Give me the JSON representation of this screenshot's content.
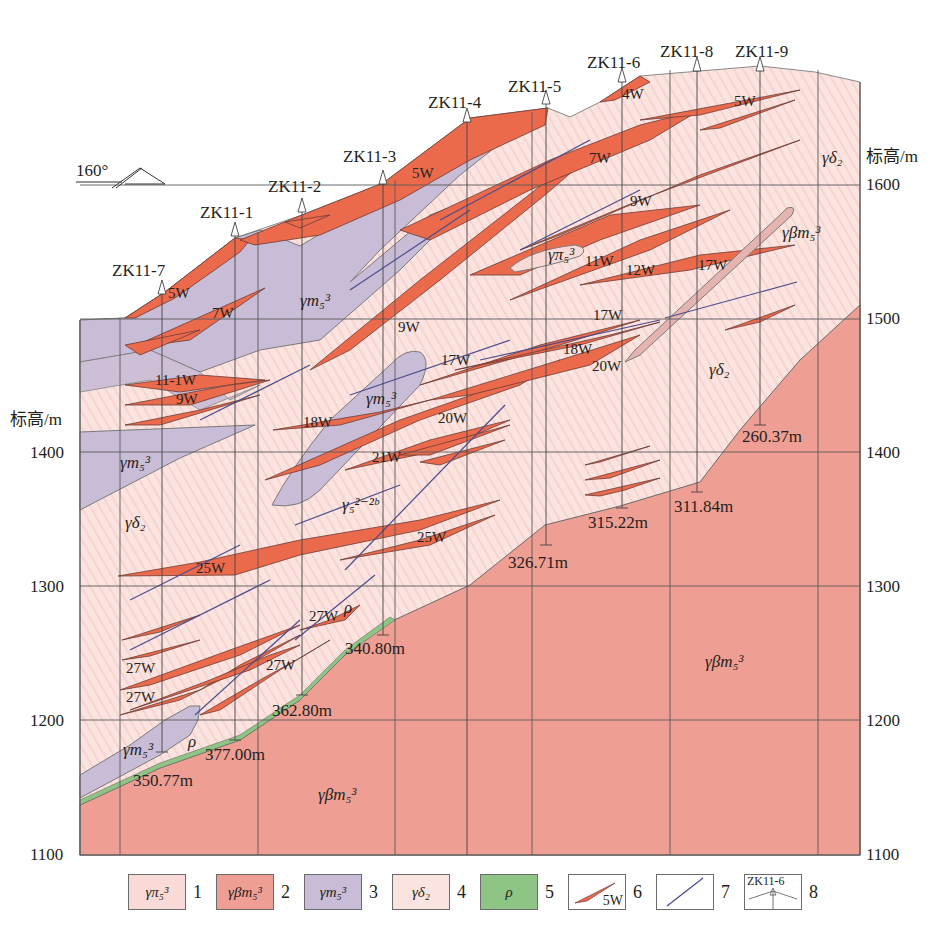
{
  "diagram": {
    "type": "geological-cross-section",
    "orientation": {
      "label": "160°"
    },
    "elevation_axis": {
      "title": "标高/m",
      "ticks": [
        1600,
        1500,
        1400,
        1300,
        1200,
        1100
      ],
      "left_ticks": [
        1400,
        1300,
        1200,
        1100
      ],
      "right_ticks": [
        1600,
        1500,
        1400,
        1300,
        1200,
        1100
      ]
    },
    "boreholes": [
      {
        "id": "ZK11-7",
        "x": 162,
        "top": 290,
        "bottom": 752,
        "depth": "350.77m",
        "depth_label_x": 133,
        "depth_label_y": 786
      },
      {
        "id": "ZK11-1",
        "x": 235,
        "top": 232,
        "bottom": 740,
        "depth": "377.00m",
        "depth_label_x": 205,
        "depth_label_y": 760
      },
      {
        "id": "ZK11-2",
        "x": 302,
        "top": 208,
        "bottom": 695,
        "depth": "362.80m",
        "depth_label_x": 272,
        "depth_label_y": 716
      },
      {
        "id": "ZK11-3",
        "x": 383,
        "top": 180,
        "bottom": 635,
        "depth": "340.80m",
        "depth_label_x": 345,
        "depth_label_y": 654
      },
      {
        "id": "ZK11-4",
        "x": 467,
        "top": 118,
        "bottom": 0,
        "depth": "",
        "depth_label_x": 0,
        "depth_label_y": 0
      },
      {
        "id": "ZK11-5",
        "x": 546,
        "top": 100,
        "bottom": 545,
        "depth": "326.71m",
        "depth_label_x": 508,
        "depth_label_y": 568
      },
      {
        "id": "ZK11-6",
        "x": 622,
        "top": 78,
        "bottom": 508,
        "depth": "315.22m",
        "depth_label_x": 588,
        "depth_label_y": 528
      },
      {
        "id": "ZK11-8",
        "x": 697,
        "top": 67,
        "bottom": 492,
        "depth": "311.84m",
        "depth_label_x": 674,
        "depth_label_y": 512
      },
      {
        "id": "ZK11-9",
        "x": 760,
        "top": 67,
        "bottom": 425,
        "depth": "260.37m",
        "depth_label_x": 742,
        "depth_label_y": 442
      }
    ],
    "borehole_labels": [
      {
        "id": "ZK11-7",
        "x": 112,
        "y": 276
      },
      {
        "id": "ZK11-1",
        "x": 200,
        "y": 218
      },
      {
        "id": "ZK11-2",
        "x": 268,
        "y": 192
      },
      {
        "id": "ZK11-3",
        "x": 343,
        "y": 162
      },
      {
        "id": "ZK11-4",
        "x": 428,
        "y": 108
      },
      {
        "id": "ZK11-5",
        "x": 508,
        "y": 92
      },
      {
        "id": "ZK11-6",
        "x": 587,
        "y": 68
      },
      {
        "id": "ZK11-8",
        "x": 660,
        "y": 57
      },
      {
        "id": "ZK11-9",
        "x": 735,
        "y": 57
      }
    ],
    "vein_labels": [
      {
        "text": "5W",
        "x": 168,
        "y": 298
      },
      {
        "text": "7W",
        "x": 212,
        "y": 318
      },
      {
        "text": "11-1W",
        "x": 155,
        "y": 385
      },
      {
        "text": "9W",
        "x": 176,
        "y": 404
      },
      {
        "text": "18W",
        "x": 303,
        "y": 427
      },
      {
        "text": "21W",
        "x": 372,
        "y": 462
      },
      {
        "text": "20W",
        "x": 438,
        "y": 423
      },
      {
        "text": "17W",
        "x": 441,
        "y": 365
      },
      {
        "text": "9W",
        "x": 398,
        "y": 332
      },
      {
        "text": "5W",
        "x": 412,
        "y": 178
      },
      {
        "text": "7W",
        "x": 589,
        "y": 163
      },
      {
        "text": "9W",
        "x": 630,
        "y": 206
      },
      {
        "text": "4W",
        "x": 622,
        "y": 99
      },
      {
        "text": "5W",
        "x": 734,
        "y": 106
      },
      {
        "text": "11W",
        "x": 585,
        "y": 266
      },
      {
        "text": "12W",
        "x": 626,
        "y": 275
      },
      {
        "text": "17W",
        "x": 698,
        "y": 270
      },
      {
        "text": "17W",
        "x": 593,
        "y": 320
      },
      {
        "text": "18W",
        "x": 563,
        "y": 354
      },
      {
        "text": "20W",
        "x": 592,
        "y": 371
      },
      {
        "text": "25W",
        "x": 196,
        "y": 573
      },
      {
        "text": "25W",
        "x": 417,
        "y": 542
      },
      {
        "text": "27W",
        "x": 309,
        "y": 621
      },
      {
        "text": "27W",
        "x": 126,
        "y": 673
      },
      {
        "text": "27W",
        "x": 126,
        "y": 702
      },
      {
        "text": "27W",
        "x": 266,
        "y": 670
      }
    ],
    "unit_labels": [
      {
        "text": "γm₅³",
        "x": 300,
        "y": 306
      },
      {
        "text": "γm₅³",
        "x": 366,
        "y": 404
      },
      {
        "text": "γm₅³",
        "x": 120,
        "y": 468
      },
      {
        "text": "γm₅³",
        "x": 123,
        "y": 755
      },
      {
        "text": "γδ₂",
        "x": 125,
        "y": 528
      },
      {
        "text": "γδ₂",
        "x": 709,
        "y": 375
      },
      {
        "text": "γδ₂",
        "x": 822,
        "y": 163
      },
      {
        "text": "γπ₅³",
        "x": 548,
        "y": 260
      },
      {
        "text": "γβm₅³",
        "x": 782,
        "y": 238
      },
      {
        "text": "γβm₅³",
        "x": 705,
        "y": 667
      },
      {
        "text": "γβm₅³",
        "x": 318,
        "y": 800
      },
      {
        "text": "γ₅²⁻²ᵇ",
        "x": 342,
        "y": 510
      },
      {
        "text": "ρ",
        "x": 344,
        "y": 613
      },
      {
        "text": "ρ",
        "x": 188,
        "y": 747
      }
    ],
    "colors": {
      "gamma_pi": "#f9dad6",
      "gamma_beta_m": "#ef9e93",
      "gamma_m": "#c9bcd6",
      "gamma_delta": "#fbe3df",
      "rho": "#8ec585",
      "ore_vein": "#ec6a4c",
      "dike": "#4a4c8c",
      "grid": "#5a5a5a"
    }
  },
  "legend": [
    {
      "num": "1",
      "symbol": "γπ₅³",
      "meaning": "gamma-pi-5-3",
      "color": "#f9dad6"
    },
    {
      "num": "2",
      "symbol": "γβm₅³",
      "meaning": "gamma-beta-m-5-3",
      "color": "#ef9e93"
    },
    {
      "num": "3",
      "symbol": "γm₅³",
      "meaning": "gamma-m-5-3",
      "color": "#c9bcd6"
    },
    {
      "num": "4",
      "symbol": "γδ₂",
      "meaning": "gamma-delta-2",
      "color": "#fbe3df"
    },
    {
      "num": "5",
      "symbol": "ρ",
      "meaning": "rho",
      "color": "#8ec585"
    },
    {
      "num": "6",
      "symbol": "5W",
      "meaning": "ore-vein"
    },
    {
      "num": "7",
      "symbol": "",
      "meaning": "dike-line"
    },
    {
      "num": "8",
      "symbol": "ZK11-6",
      "meaning": "borehole"
    }
  ]
}
